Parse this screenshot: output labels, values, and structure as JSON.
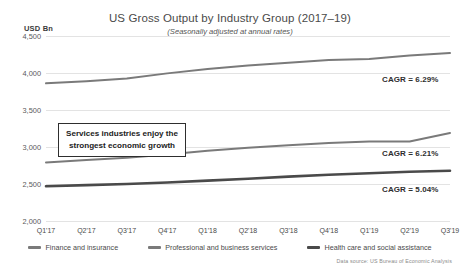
{
  "unit_label": "USD Bn",
  "source_note": "Data source: US Bureau of Economic Analysis",
  "callout": {
    "line1": "Services industries enjoy the",
    "line2": "strongest economic growth"
  },
  "annotations": [
    {
      "name": "cagr-finance",
      "text": "CAGR = 6.29%"
    },
    {
      "name": "cagr-professional",
      "text": "CAGR = 6.21%"
    },
    {
      "name": "cagr-healthcare",
      "text": "CAGR = 5.04%"
    }
  ],
  "chart_data": {
    "type": "line",
    "title": "US Gross Output by Industry Group (2017–19)",
    "subtitle": "(Seasonally adjusted at annual rates)",
    "xlabel": "",
    "ylabel": "USD Bn",
    "ylim": [
      2000,
      4500
    ],
    "yticks": [
      2000,
      2500,
      3000,
      3500,
      4000,
      4500
    ],
    "ytick_labels": [
      "2,000",
      "2,500",
      "3,000",
      "3,500",
      "4,000",
      "4,500"
    ],
    "grid": true,
    "legend_position": "bottom",
    "categories": [
      "Q1'17",
      "Q2'17",
      "Q3'17",
      "Q4'17",
      "Q1'18",
      "Q2'18",
      "Q3'18",
      "Q4'18",
      "Q1'19",
      "Q2'19",
      "Q3'19"
    ],
    "series": [
      {
        "name": "Finance and insurance",
        "color": "#7a7a7a",
        "width": 2.0,
        "cagr": "6.29%",
        "values": [
          3860,
          3890,
          3925,
          3995,
          4055,
          4100,
          4140,
          4175,
          4190,
          4235,
          4270
        ]
      },
      {
        "name": "Professional and business services",
        "color": "#7a7a7a",
        "width": 2.0,
        "cagr": "6.21%",
        "values": [
          2790,
          2825,
          2855,
          2900,
          2950,
          2990,
          3025,
          3055,
          3075,
          3075,
          3190
        ]
      },
      {
        "name": "Health care and social assistance",
        "color": "#4a4a4a",
        "width": 2.6,
        "cagr": "5.04%",
        "values": [
          2470,
          2485,
          2500,
          2520,
          2545,
          2570,
          2600,
          2625,
          2645,
          2665,
          2680
        ]
      }
    ]
  }
}
